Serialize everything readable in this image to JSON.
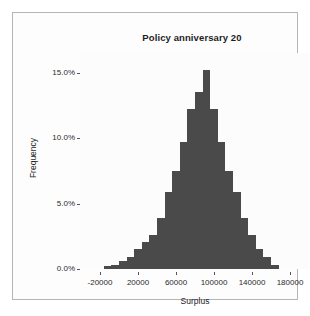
{
  "chart_data": {
    "type": "bar",
    "title": "Policy anniversary 20",
    "xlabel": "Surplus",
    "ylabel": "Frequency",
    "grid": false,
    "legend": null,
    "xlim": [
      -40000,
      200000
    ],
    "ylim": [
      0,
      16.5
    ],
    "xtick_labels": [
      "-20000",
      "20000",
      "60000",
      "100000",
      "140000",
      "180000"
    ],
    "xtick_values": [
      -20000,
      20000,
      60000,
      100000,
      140000,
      180000
    ],
    "ytick_labels": [
      "0.0%",
      "5.0%",
      "10.0%",
      "15.0%"
    ],
    "ytick_values": [
      0,
      5,
      10,
      15
    ],
    "bar_color": "#4a4a4a",
    "bin_width": 8000,
    "categories": [
      -12000,
      -4000,
      4000,
      12000,
      20000,
      28000,
      36000,
      44000,
      52000,
      60000,
      68000,
      76000,
      84000,
      92000,
      100000,
      108000,
      116000,
      124000,
      132000,
      140000,
      148000,
      156000,
      164000
    ],
    "values": [
      0.2,
      0.3,
      0.6,
      0.9,
      1.5,
      2.1,
      2.6,
      3.9,
      5.9,
      7.5,
      9.7,
      12.2,
      13.5,
      15.2,
      12.2,
      9.7,
      7.5,
      5.9,
      3.9,
      2.6,
      1.5,
      0.9,
      0.3
    ]
  },
  "figure": {
    "background": "#ffffff",
    "frame_border": "#b6b6b6"
  }
}
